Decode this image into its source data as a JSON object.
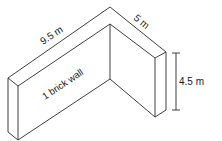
{
  "diagram": {
    "type": "isometric L-shaped wall",
    "labels": {
      "long_side": "9.5 m",
      "short_side": "5 m",
      "height": "4.5 m",
      "wall_type": "1 brick wall"
    },
    "colors": {
      "line": "#2a2a2a",
      "text": "#1a1a1a",
      "background": "#ffffff"
    }
  }
}
